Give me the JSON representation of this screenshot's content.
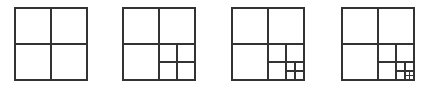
{
  "diagram": {
    "title": "",
    "stroke_color": "#333333",
    "stroke_width": 1.2,
    "background": "#ffffff",
    "panels": [
      {
        "name": "panel-depth-1",
        "x": 15,
        "y": 8,
        "size": 72,
        "depth": 1
      },
      {
        "name": "panel-depth-2",
        "x": 123,
        "y": 8,
        "size": 72,
        "depth": 2
      },
      {
        "name": "panel-depth-3",
        "x": 232,
        "y": 8,
        "size": 72,
        "depth": 3
      },
      {
        "name": "panel-depth-4",
        "x": 342,
        "y": 8,
        "size": 72,
        "depth": 4
      }
    ]
  }
}
